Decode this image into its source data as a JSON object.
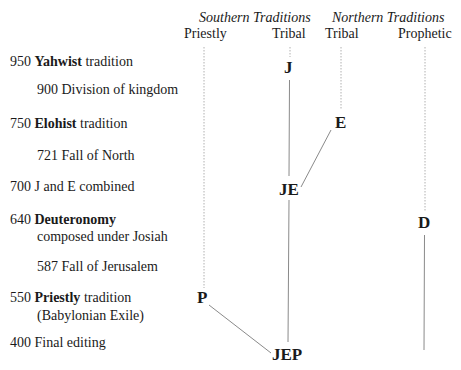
{
  "header": {
    "southern_group": "Southern Traditions",
    "northern_group": "Northern Traditions",
    "columns": [
      {
        "label": "Priestly"
      },
      {
        "label": "Tribal"
      },
      {
        "label": "Tribal"
      },
      {
        "label": "Prophetic"
      }
    ]
  },
  "timeline": [
    {
      "year": "950",
      "bold": "Yahwist",
      "rest": " tradition",
      "line2": ""
    },
    {
      "year": "900",
      "bold": "",
      "rest": " Division of kingdom",
      "line2": ""
    },
    {
      "year": "750",
      "bold": "Elohist",
      "rest": " tradition",
      "line2": ""
    },
    {
      "year": "721",
      "bold": "",
      "rest": " Fall of North",
      "line2": ""
    },
    {
      "year": "700",
      "bold": "",
      "rest": " J and E combined",
      "line2": ""
    },
    {
      "year": "640",
      "bold": "Deuteronomy",
      "rest": "",
      "line2": "composed under Josiah"
    },
    {
      "year": "587",
      "bold": "",
      "rest": " Fall of Jerusalem",
      "line2": ""
    },
    {
      "year": "550",
      "bold": "Priestly",
      "rest": " tradition",
      "line2": "(Babylonian Exile)"
    },
    {
      "year": "400",
      "bold": "",
      "rest": " Final editing",
      "line2": ""
    }
  ],
  "nodes": {
    "J": "J",
    "E": "E",
    "JE": "JE",
    "D": "D",
    "P": "P",
    "JEP": "JEP"
  },
  "colors": {
    "text": "#1a1a1a",
    "line": "#8a8a8a",
    "dotted": "#b0b0b0"
  }
}
